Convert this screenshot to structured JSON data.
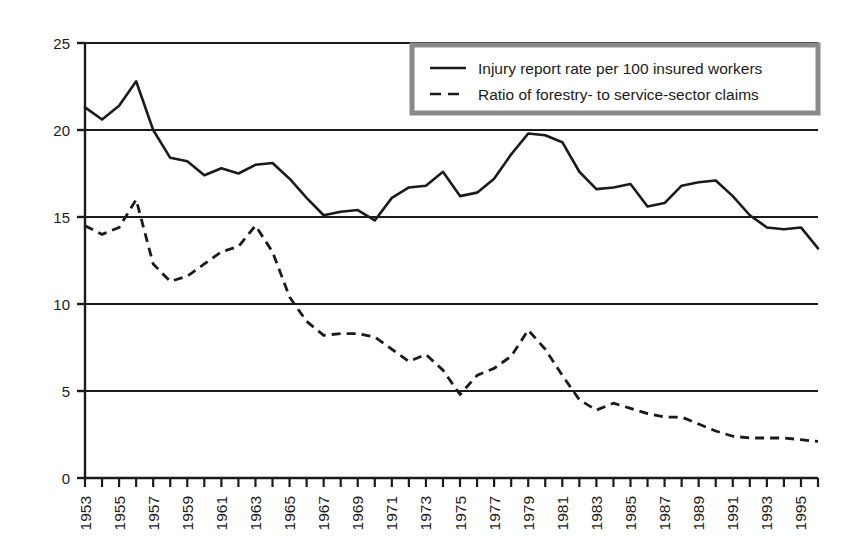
{
  "chart_data": {
    "type": "line",
    "title": "",
    "subtitle": "",
    "xlabel": "",
    "ylabel": "",
    "xlim": [
      1953,
      1996
    ],
    "ylim": [
      0,
      25
    ],
    "yticks": [
      0,
      5,
      10,
      15,
      20,
      25
    ],
    "ytick_labels": [
      "0",
      "5",
      "10",
      "15",
      "20",
      "25"
    ],
    "grid": "horizontal gridlines at 5, 10, 15, 20",
    "legend_position": "top-right inside plot area",
    "x": [
      1953,
      1954,
      1955,
      1956,
      1957,
      1958,
      1959,
      1960,
      1961,
      1962,
      1963,
      1964,
      1965,
      1966,
      1967,
      1968,
      1969,
      1970,
      1971,
      1972,
      1973,
      1974,
      1975,
      1976,
      1977,
      1978,
      1979,
      1980,
      1981,
      1982,
      1983,
      1984,
      1985,
      1986,
      1987,
      1988,
      1989,
      1990,
      1991,
      1992,
      1993,
      1994,
      1995,
      1996
    ],
    "xtick_labels": [
      "1953",
      "1955",
      "1957",
      "1959",
      "1961",
      "1963",
      "1965",
      "1967",
      "1969",
      "1971",
      "1973",
      "1975",
      "1977",
      "1979",
      "1981",
      "1983",
      "1985",
      "1987",
      "1989",
      "1991",
      "1993",
      "1995"
    ],
    "series": [
      {
        "name": "Injury report rate per 100 insured workers",
        "style": "solid",
        "color": "#1b1b1b",
        "values": [
          21.3,
          20.6,
          21.4,
          22.8,
          20.0,
          18.4,
          18.2,
          17.4,
          17.8,
          17.5,
          18.0,
          18.1,
          17.2,
          16.1,
          15.1,
          15.3,
          15.4,
          14.8,
          16.1,
          16.7,
          16.8,
          17.6,
          16.2,
          16.4,
          17.2,
          18.6,
          19.8,
          19.7,
          19.3,
          17.6,
          16.6,
          16.7,
          16.9,
          15.6,
          15.8,
          16.8,
          17.0,
          17.1,
          16.2,
          15.1,
          14.4,
          14.3,
          14.4,
          13.2
        ]
      },
      {
        "name": "Ratio of forestry- to service-sector claims",
        "style": "dashed",
        "color": "#1b1b1b",
        "values": [
          14.5,
          14.0,
          14.4,
          16.0,
          12.3,
          11.3,
          11.6,
          12.3,
          13.0,
          13.3,
          14.5,
          13.0,
          10.4,
          9.0,
          8.2,
          8.3,
          8.3,
          8.1,
          7.4,
          6.7,
          7.1,
          6.2,
          4.8,
          5.9,
          6.3,
          7.0,
          8.5,
          7.4,
          5.9,
          4.5,
          3.9,
          4.3,
          4.0,
          3.7,
          3.5,
          3.5,
          3.1,
          2.7,
          2.4,
          2.3,
          2.3,
          2.3,
          2.2,
          2.1
        ]
      }
    ]
  },
  "legend": {
    "items": [
      {
        "label": "Injury report rate per 100 insured workers",
        "style": "solid"
      },
      {
        "label": "Ratio of forestry- to service-sector claims",
        "style": "dashed"
      }
    ],
    "border_color": "#8a8a8a",
    "background_color": "#ffffff"
  },
  "axis": {
    "line_color": "#1b1b1b",
    "gridline_color": "#1b1b1b"
  }
}
